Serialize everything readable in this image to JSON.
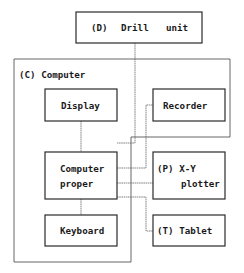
{
  "diagram": {
    "drill_unit": {
      "code": "(D)",
      "word1": "Drill",
      "word2": "unit"
    },
    "computer_group": {
      "label": "(C) Computer"
    },
    "display": {
      "label": "Display"
    },
    "computer_proper": {
      "line1": "Computer",
      "line2": "proper"
    },
    "keyboard": {
      "label": "Keyboard"
    },
    "recorder": {
      "label": "Recorder"
    },
    "xy_plotter": {
      "line1": "(P) X-Y",
      "line2": "plotter"
    },
    "tablet": {
      "label": "(T) Tablet"
    }
  },
  "colors": {
    "line": "#2a2a2a",
    "background": "#ffffff"
  }
}
